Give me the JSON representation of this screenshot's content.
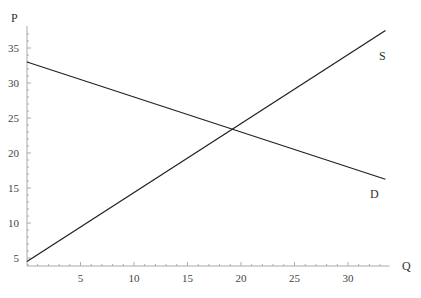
{
  "chart_data": {
    "type": "line",
    "title": "",
    "xlabel": "Q",
    "ylabel": "P",
    "xlim": [
      0,
      33.5
    ],
    "ylim": [
      3.9,
      38
    ],
    "x_ticks": [
      5,
      10,
      15,
      20,
      25,
      30
    ],
    "y_ticks": [
      5,
      10,
      15,
      20,
      25,
      30,
      35
    ],
    "grid": false,
    "legend": "none",
    "series": [
      {
        "name": "S",
        "x": [
          0,
          33.5
        ],
        "values": [
          4.5,
          37.5
        ]
      },
      {
        "name": "D",
        "x": [
          0,
          33.5
        ],
        "values": [
          33,
          16.25
        ]
      }
    ],
    "annotations": [
      {
        "text": "S",
        "x": 32,
        "y": 35
      },
      {
        "text": "D",
        "x": 32,
        "y": 14
      },
      {
        "text": "equilibrium",
        "x": 19,
        "y": 23.5
      }
    ]
  },
  "labels": {
    "x_axis": "Q",
    "y_axis": "P",
    "supply": "S",
    "demand": "D"
  }
}
